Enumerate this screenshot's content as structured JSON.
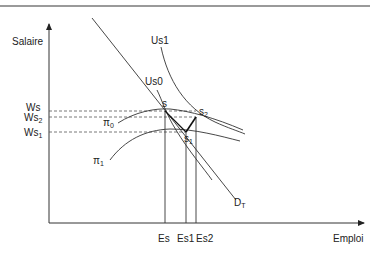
{
  "diagram": {
    "type": "labor-market-wage-employment",
    "axes": {
      "y_label": "Salaire",
      "x_label": "Emploi"
    },
    "wage_levels": [
      {
        "label": "Ws",
        "sub": ""
      },
      {
        "label": "Ws",
        "sub": "2"
      },
      {
        "label": "Ws",
        "sub": "1"
      }
    ],
    "employment_levels": [
      "Es",
      "Es1",
      "Es2"
    ],
    "curves": {
      "demand": {
        "label": "D",
        "sub": "T"
      },
      "us0": "Us0",
      "us1": "Us1",
      "pi0": {
        "label": "π",
        "sub": "0"
      },
      "pi1": {
        "label": "π",
        "sub": "1"
      }
    },
    "points": {
      "s": {
        "label": "s",
        "sub": ""
      },
      "s1": {
        "label": "s",
        "sub": "1"
      },
      "s2": {
        "label": "s",
        "sub": "2"
      }
    },
    "colors": {
      "line": "#333333",
      "dashed": "#555555",
      "rule": "#9a9a9a"
    }
  }
}
